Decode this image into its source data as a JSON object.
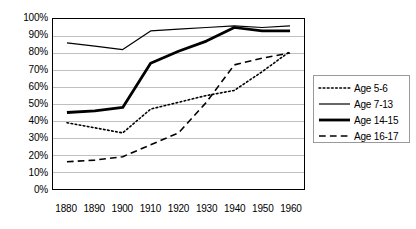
{
  "chart_data": {
    "type": "line",
    "title": "",
    "subtitle": "",
    "xlabel": "",
    "ylabel": "",
    "categories": [
      "1880",
      "1890",
      "1900",
      "1910",
      "1920",
      "1930",
      "1940",
      "1950",
      "1960"
    ],
    "ylim": [
      0,
      100
    ],
    "ytick_labels": [
      "0%",
      "10%",
      "20%",
      "30%",
      "40%",
      "50%",
      "60%",
      "70%",
      "80%",
      "90%",
      "100%"
    ],
    "ytick_values": [
      0,
      10,
      20,
      30,
      40,
      50,
      60,
      70,
      80,
      90,
      100
    ],
    "grid": "horizontal",
    "legend_position": "right",
    "series": [
      {
        "name": "Age 5-6",
        "style": "dotted",
        "width": 1.6,
        "color": "#000000",
        "values": [
          39,
          36,
          33,
          47,
          51,
          55,
          58,
          69,
          81
        ]
      },
      {
        "name": "Age 7-13",
        "style": "solid-thin",
        "width": 1.2,
        "color": "#000000",
        "values": [
          86,
          84,
          82,
          93,
          94,
          95,
          96,
          95,
          96
        ]
      },
      {
        "name": "Age 14-15",
        "style": "solid-thick",
        "width": 2.8,
        "color": "#000000",
        "values": [
          45,
          46,
          48,
          74,
          81,
          87,
          95,
          93,
          93
        ]
      },
      {
        "name": "Age 16-17",
        "style": "dashed",
        "width": 1.6,
        "color": "#000000",
        "values": [
          16,
          17,
          19,
          26,
          33,
          51,
          73,
          77,
          80
        ]
      }
    ]
  },
  "axes": {
    "frame_color": "#000000",
    "gridline_color": "#c0c0c0",
    "background": "#ffffff"
  },
  "legend": {
    "border_color": "#9a9a9a",
    "entries": [
      "Age 5-6",
      "Age 7-13",
      "Age 14-15",
      "Age 16-17"
    ]
  }
}
